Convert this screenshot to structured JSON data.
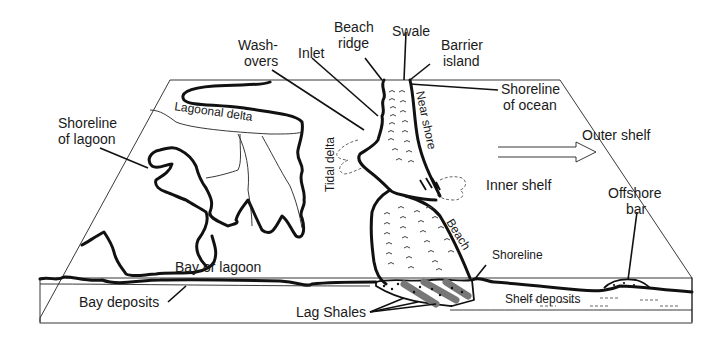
{
  "diagram": {
    "colors": {
      "background": "#ffffff",
      "line": "#111111",
      "lag_shale": "#777777"
    },
    "labels": {
      "washovers_line1": "Wash-",
      "washovers_line2": "overs",
      "inlet": "Inlet",
      "beach_ridge_line1": "Beach",
      "beach_ridge_line2": "ridge",
      "swale": "Swale",
      "barrier_island_line1": "Barrier",
      "barrier_island_line2": "island",
      "shoreline_ocean_line1": "Shoreline",
      "shoreline_ocean_line2": "of ocean",
      "shoreline_lagoon_line1": "Shoreline",
      "shoreline_lagoon_line2": "of lagoon",
      "lagoonal_delta": "Lagoonal delta",
      "tidal_delta": "Tidal delta",
      "near_shore": "Near shore",
      "outer_shelf": "Outer shelf",
      "inner_shelf": "Inner shelf",
      "offshore_bar_line1": "Offshore",
      "offshore_bar_line2": "bar",
      "beach": "Beach",
      "shoreline": "Shoreline",
      "bay_or_lagoon": "Bay or lagoon",
      "bay_deposits": "Bay deposits",
      "lag_shales": "Lag Shales",
      "shelf_deposits": "Shelf deposits"
    }
  }
}
